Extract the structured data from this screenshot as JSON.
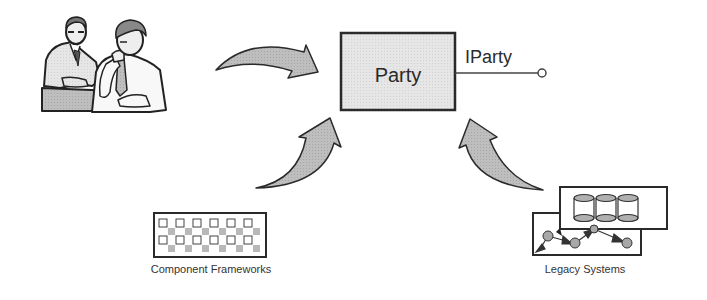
{
  "diagram": {
    "central_component": {
      "label": "Party",
      "interface_label": "IParty"
    },
    "sources": [
      {
        "id": "business-people",
        "label": "",
        "icon": "businessmen-meeting-icon"
      },
      {
        "id": "component-frameworks",
        "label": "Component Frameworks",
        "icon": "component-framework-grid-icon"
      },
      {
        "id": "legacy-systems",
        "label": "Legacy Systems",
        "icon": "legacy-database-network-icon"
      }
    ],
    "colors": {
      "box_fill": "#e4e4e4",
      "arrow_fill": "#bdbdbd",
      "stroke": "#2a2a2a",
      "node_fill": "#a8a8a8"
    }
  }
}
